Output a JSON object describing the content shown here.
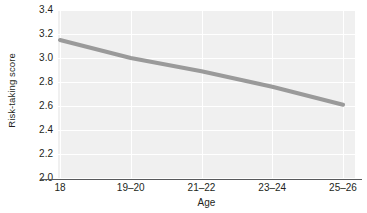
{
  "chart_data": {
    "type": "line",
    "title": "",
    "xlabel": "Age",
    "ylabel": "Risk-taking score",
    "categories": [
      "18",
      "19–20",
      "21–22",
      "23–24",
      "25–26"
    ],
    "values": [
      3.15,
      3.0,
      2.89,
      2.76,
      2.61
    ],
    "series": [
      {
        "name": "Risk-taking score",
        "values": [
          3.15,
          3.0,
          2.89,
          2.76,
          2.61
        ],
        "color": "#9a9a9a"
      }
    ],
    "ylim": [
      2.0,
      3.4
    ],
    "yticks": [
      "3.4",
      "3.2",
      "3.0",
      "2.8",
      "2.6",
      "2.4",
      "2.2",
      "2.0"
    ],
    "ytick_values": [
      3.4,
      3.2,
      3.0,
      2.8,
      2.6,
      2.4,
      2.2,
      2.0
    ],
    "grid": true,
    "grid_color": "#ffffff",
    "panel_color": "#f0f0f0",
    "axis_color": "#58595b",
    "legend": false,
    "legend_position": "none"
  }
}
